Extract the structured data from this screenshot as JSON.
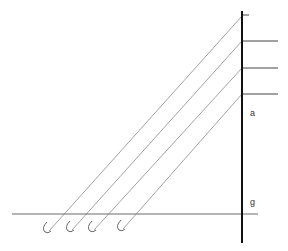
{
  "diagram": {
    "labels": {
      "a": "a",
      "g": "g"
    },
    "colors": {
      "vertical_line": "#111111",
      "horizontal_lines": "#444444",
      "diagonal_lines": "#888888",
      "hooks": "#666666",
      "baseline": "#666666",
      "text": "#333333"
    },
    "vertical_line": {
      "x": 242,
      "y1": 11,
      "y2": 243
    },
    "baseline": {
      "y": 214,
      "x1": 12,
      "x2": 258
    },
    "top_tick": {
      "y": 15,
      "x1": 242,
      "x2": 249
    },
    "horizontal_lines": [
      {
        "y": 41,
        "x1": 242,
        "x2": 278
      },
      {
        "y": 68,
        "x1": 242,
        "x2": 278
      },
      {
        "y": 94,
        "x1": 242,
        "x2": 278
      }
    ],
    "diagonal_lines": [
      {
        "x1": 242,
        "y1": 16,
        "x2": 49,
        "y2": 231
      },
      {
        "x1": 242,
        "y1": 41,
        "x2": 72,
        "y2": 230
      },
      {
        "x1": 242,
        "y1": 68,
        "x2": 94,
        "y2": 230
      },
      {
        "x1": 242,
        "y1": 94,
        "x2": 123,
        "y2": 229
      }
    ],
    "hooks": [
      {
        "cx": 49,
        "cy": 228
      },
      {
        "cx": 72,
        "cy": 227
      },
      {
        "cx": 94,
        "cy": 227
      },
      {
        "cx": 123,
        "cy": 226
      }
    ]
  }
}
